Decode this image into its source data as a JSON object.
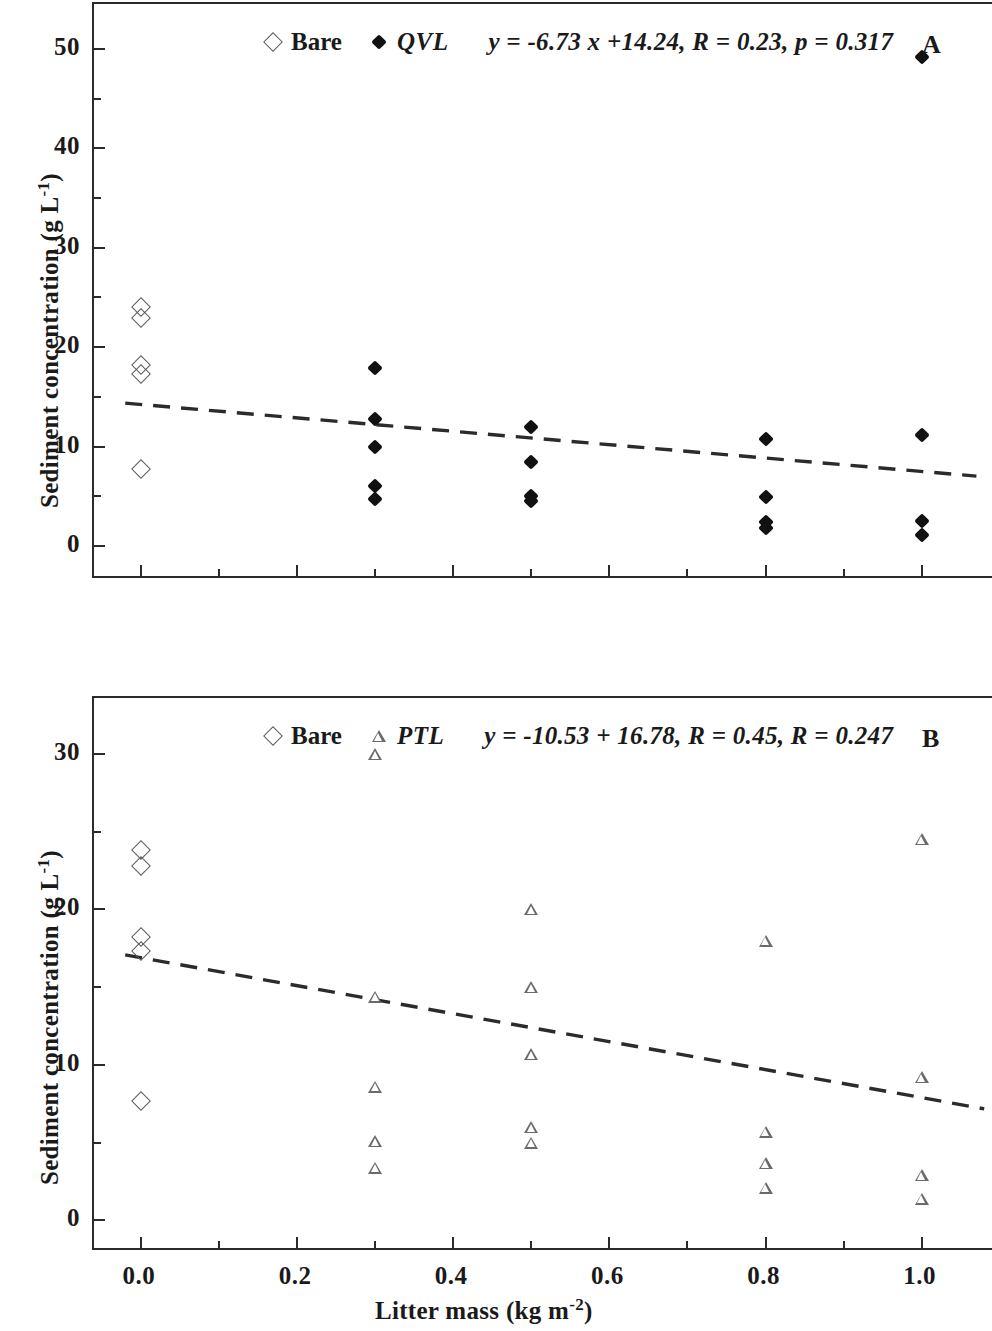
{
  "figure": {
    "axis_titles": {
      "y": "Sediment concentration (g L",
      "y_sup": "-1",
      "y_tail": ")",
      "x": "Litter mass (kg m",
      "x_sup": "-2",
      "x_tail": ")"
    },
    "x_ticks": [
      "0.0",
      "0.2",
      "0.4",
      "0.6",
      "0.8",
      "1.0"
    ]
  },
  "panels": {
    "a": {
      "letter": "A",
      "legend": {
        "bare_label": "Bare",
        "series_label": "QVL",
        "equation": "y = -6.73 x +14.24, R = 0.23, p = 0.317"
      },
      "y_ticks": [
        "0",
        "10",
        "20",
        "30",
        "40",
        "50"
      ]
    },
    "b": {
      "letter": "B",
      "legend": {
        "bare_label": "Bare",
        "series_label": "PTL",
        "equation": "y = -10.53 + 16.78, R = 0.45, R = 0.247"
      },
      "y_ticks": [
        "0",
        "10",
        "20",
        "30"
      ]
    }
  },
  "chart_data": [
    {
      "type": "scatter",
      "panel": "A",
      "title": "",
      "xlabel": "Litter mass (kg m-2)",
      "ylabel": "Sediment concentration (g L-1)",
      "xlim": [
        -0.06,
        1.09
      ],
      "ylim": [
        -3.2,
        54.5
      ],
      "xticks": [
        0.0,
        0.2,
        0.4,
        0.6,
        0.8,
        1.0
      ],
      "yticks": [
        0,
        10,
        20,
        30,
        40,
        50
      ],
      "yminor": [
        5,
        15,
        25,
        35,
        45
      ],
      "grid": false,
      "legend_position": "top-center",
      "series": [
        {
          "name": "Bare",
          "marker": "open-diamond",
          "points": [
            {
              "x": 0.0,
              "y": 24.0
            },
            {
              "x": 0.0,
              "y": 22.9
            },
            {
              "x": 0.0,
              "y": 18.2
            },
            {
              "x": 0.0,
              "y": 17.3
            },
            {
              "x": 0.0,
              "y": 7.8
            }
          ]
        },
        {
          "name": "QVL",
          "marker": "filled-diamond",
          "points": [
            {
              "x": 0.3,
              "y": 17.9
            },
            {
              "x": 0.3,
              "y": 12.8
            },
            {
              "x": 0.3,
              "y": 10.0
            },
            {
              "x": 0.3,
              "y": 6.0
            },
            {
              "x": 0.3,
              "y": 4.7
            },
            {
              "x": 0.5,
              "y": 12.0
            },
            {
              "x": 0.5,
              "y": 8.5
            },
            {
              "x": 0.5,
              "y": 5.0
            },
            {
              "x": 0.5,
              "y": 4.5
            },
            {
              "x": 0.8,
              "y": 10.8
            },
            {
              "x": 0.8,
              "y": 4.9
            },
            {
              "x": 0.8,
              "y": 2.4
            },
            {
              "x": 0.8,
              "y": 1.8
            },
            {
              "x": 1.0,
              "y": 49.2
            },
            {
              "x": 1.0,
              "y": 11.2
            },
            {
              "x": 1.0,
              "y": 2.5
            },
            {
              "x": 1.0,
              "y": 1.1
            }
          ]
        }
      ],
      "fit": {
        "style": "dashed",
        "equation": "y = -6.73 x + 14.24",
        "slope": -6.73,
        "intercept": 14.24,
        "R": 0.23,
        "p": 0.317,
        "x_start": -0.02,
        "x_end": 1.07
      }
    },
    {
      "type": "scatter",
      "panel": "B",
      "title": "",
      "xlabel": "Litter mass (kg m-2)",
      "ylabel": "Sediment concentration (g L-1)",
      "xlim": [
        -0.06,
        1.09
      ],
      "ylim": [
        -1.9,
        33.6
      ],
      "xticks": [
        0.0,
        0.2,
        0.4,
        0.6,
        0.8,
        1.0
      ],
      "yticks": [
        0,
        10,
        20,
        30
      ],
      "yminor": [
        5,
        15,
        25
      ],
      "grid": false,
      "legend_position": "top-center",
      "series": [
        {
          "name": "Bare",
          "marker": "open-diamond",
          "points": [
            {
              "x": 0.0,
              "y": 23.8
            },
            {
              "x": 0.0,
              "y": 22.8
            },
            {
              "x": 0.0,
              "y": 18.2
            },
            {
              "x": 0.0,
              "y": 17.3
            },
            {
              "x": 0.0,
              "y": 7.7
            }
          ]
        },
        {
          "name": "PTL",
          "marker": "open-triangle",
          "points": [
            {
              "x": 0.3,
              "y": 30.0
            },
            {
              "x": 0.3,
              "y": 14.4
            },
            {
              "x": 0.3,
              "y": 8.6
            },
            {
              "x": 0.3,
              "y": 5.1
            },
            {
              "x": 0.3,
              "y": 3.4
            },
            {
              "x": 0.5,
              "y": 20.0
            },
            {
              "x": 0.5,
              "y": 15.0
            },
            {
              "x": 0.5,
              "y": 10.7
            },
            {
              "x": 0.5,
              "y": 6.0
            },
            {
              "x": 0.5,
              "y": 5.0
            },
            {
              "x": 0.8,
              "y": 18.0
            },
            {
              "x": 0.8,
              "y": 5.7
            },
            {
              "x": 0.8,
              "y": 3.7
            },
            {
              "x": 0.8,
              "y": 2.1
            },
            {
              "x": 1.0,
              "y": 24.5
            },
            {
              "x": 1.0,
              "y": 9.2
            },
            {
              "x": 1.0,
              "y": 2.9
            },
            {
              "x": 1.0,
              "y": 1.4
            }
          ]
        }
      ],
      "fit": {
        "style": "dashed",
        "equation": "y = -10.53 x + 16.78",
        "slope": -9.0,
        "intercept": 16.9,
        "R": 0.45,
        "p": 0.247,
        "x_start": -0.02,
        "x_end": 1.08
      }
    }
  ]
}
